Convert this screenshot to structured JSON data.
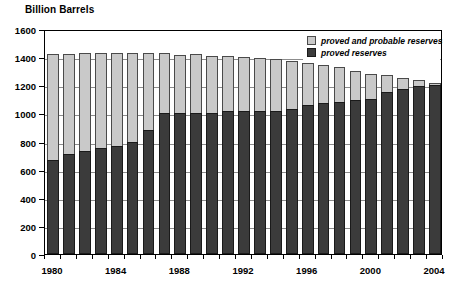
{
  "chart_data": {
    "type": "bar",
    "title": "Billion Barrels",
    "xlabel": "",
    "ylabel": "Billion Barrels",
    "ylim": [
      0,
      1600
    ],
    "ytick_step": 200,
    "yticks": [
      0,
      200,
      400,
      600,
      800,
      1000,
      1200,
      1400,
      1600
    ],
    "grid": true,
    "legend_position": "top-right",
    "categories": [
      "1980",
      "1981",
      "1982",
      "1983",
      "1984",
      "1985",
      "1986",
      "1987",
      "1988",
      "1989",
      "1990",
      "1991",
      "1992",
      "1993",
      "1994",
      "1995",
      "1996",
      "1997",
      "1998",
      "1999",
      "2000",
      "2001",
      "2002",
      "2003",
      "2004"
    ],
    "xtick_labels": [
      "1980",
      "1984",
      "1988",
      "1992",
      "1996",
      "2000",
      "2004"
    ],
    "series": [
      {
        "name": "proved and probable reserves",
        "color": "#c9c9c9",
        "values": [
          1425,
          1425,
          1430,
          1430,
          1428,
          1430,
          1428,
          1430,
          1415,
          1420,
          1405,
          1405,
          1400,
          1395,
          1390,
          1370,
          1355,
          1345,
          1330,
          1300,
          1280,
          1270,
          1250,
          1240,
          1215
        ]
      },
      {
        "name": "proved reserves",
        "color": "#3b3b3b",
        "values": [
          670,
          710,
          730,
          755,
          770,
          800,
          880,
          1000,
          1005,
          1005,
          1005,
          1020,
          1020,
          1020,
          1020,
          1030,
          1060,
          1075,
          1080,
          1095,
          1100,
          1150,
          1170,
          1195,
          1200
        ]
      }
    ]
  },
  "legend": {
    "items": [
      {
        "label": "proved and probable reserves",
        "swatch": "light-gray-swatch"
      },
      {
        "label": "proved reserves",
        "swatch": "dark-gray-swatch"
      }
    ]
  }
}
